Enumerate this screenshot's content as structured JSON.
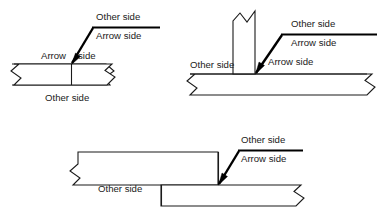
{
  "figure": {
    "line_color": "#1a1a1a",
    "background_color": "#ffffff",
    "accent_color": "#000000"
  },
  "labels": {
    "other_side": "Other side",
    "arrow_side": "Arrow side"
  },
  "diagrams": [
    {
      "id": "butt-joint",
      "name": "butt-joint-diagram",
      "texts": {
        "ref_other_side": "Other side",
        "ref_arrow_side": "Arrow side",
        "joint_arrow_left": "Arrow",
        "joint_arrow_right": "side",
        "plate_other_side": "Other side"
      }
    },
    {
      "id": "tee-joint",
      "name": "tee-joint-diagram",
      "texts": {
        "ref_other_side": "Other side",
        "ref_arrow_side": "Arrow side",
        "joint_arrow_side": "Arrow side",
        "member_other_side": "Other side"
      }
    },
    {
      "id": "lap-joint",
      "name": "lap-joint-diagram",
      "texts": {
        "ref_other_side": "Other side",
        "ref_arrow_side": "Arrow side",
        "plate_other_side": "Other side"
      }
    }
  ]
}
